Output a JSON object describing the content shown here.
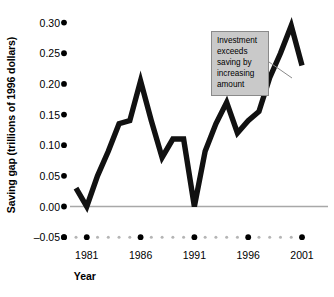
{
  "chart_data": {
    "type": "line",
    "title": "",
    "xlabel": "Year",
    "ylabel": "Saving gap (trillions of 1996 dollars)",
    "ylim": [
      -0.05,
      0.3
    ],
    "xlim": [
      1980,
      2001
    ],
    "yticks": [
      "0.30",
      "0.25",
      "0.20",
      "0.15",
      "0.10",
      "0.05",
      "0.00",
      "–0.05"
    ],
    "ytick_values": [
      0.3,
      0.25,
      0.2,
      0.15,
      0.1,
      0.05,
      0.0,
      -0.05
    ],
    "xticks": [
      "1981",
      "1986",
      "1991",
      "1996",
      "2001"
    ],
    "xtick_values": [
      1981,
      1986,
      1991,
      1996,
      2001
    ],
    "grid": false,
    "legend": "none",
    "zero_line": true,
    "series": [
      {
        "name": "Saving gap",
        "color": "#111111",
        "x": [
          1980,
          1981,
          1982,
          1983,
          1984,
          1985,
          1986,
          1987,
          1988,
          1989,
          1990,
          1991,
          1992,
          1993,
          1994,
          1995,
          1996,
          1997,
          1998,
          1999,
          2000,
          2001
        ],
        "values": [
          0.03,
          0.0,
          0.05,
          0.09,
          0.135,
          0.14,
          0.205,
          0.14,
          0.08,
          0.11,
          0.11,
          0.0,
          0.09,
          0.135,
          0.17,
          0.12,
          0.14,
          0.155,
          0.21,
          0.25,
          0.295,
          0.23
        ]
      }
    ],
    "annotations": [
      {
        "text": "Investment exceeds saving by increasing amount",
        "lines": [
          "Investment",
          "exceeds",
          "saving by",
          "increasing",
          "amount"
        ],
        "background": "#c9c9c9",
        "border": "#8a8a8a",
        "leader_line": true
      }
    ]
  },
  "axis": {
    "y_title": "Saving gap (trillions of 1996 dollars)",
    "x_title": "Year"
  },
  "annotation": {
    "line1": "Investment",
    "line2": "exceeds",
    "line3": "saving by",
    "line4": "increasing",
    "line5": "amount"
  },
  "colors": {
    "line": "#111111",
    "baseline": "#a8a8a8",
    "annotation_fill": "#c9c9c9",
    "annotation_border": "#8a8a8a",
    "tick_dot": "#000000",
    "minor_dot": "#b5b5b5"
  }
}
